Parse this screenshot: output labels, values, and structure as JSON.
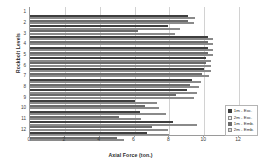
{
  "chart_data": {
    "type": "bar",
    "orientation": "horizontal",
    "title": "",
    "xlabel": "Axial Force (ton.)",
    "ylabel": "Rockbolt Levels",
    "categories": [
      "1",
      "2",
      "3",
      "4",
      "5",
      "6",
      "7",
      "8",
      "9",
      "10",
      "11",
      "12"
    ],
    "xticks": [
      0,
      2,
      4,
      6,
      8,
      10,
      12
    ],
    "xlim": [
      0,
      12
    ],
    "grid": true,
    "legend_position": "bottom-right",
    "series": [
      {
        "name": "1m - Exc.",
        "color": "#3f3f3f",
        "values": [
          9.1,
          7.9,
          10.2,
          10.2,
          10.1,
          10.0,
          9.3,
          9.0,
          6.0,
          6.3,
          8.2,
          6.7
        ]
      },
      {
        "name": "2m - Exc.",
        "color": "#f2f2f2",
        "values": [
          9.5,
          8.6,
          10.5,
          10.5,
          10.4,
          10.4,
          9.8,
          9.6,
          7.3,
          7.8,
          9.6,
          8.0
        ]
      },
      {
        "name": "1m - Emb.",
        "color": "#6b6b6b",
        "values": [
          9.1,
          6.2,
          10.2,
          10.2,
          10.1,
          9.9,
          9.2,
          8.4,
          6.6,
          5.1,
          7.0,
          5.0
        ]
      },
      {
        "name": "2m - Emb.",
        "color": "#d6d6d6",
        "values": [
          9.4,
          8.3,
          10.5,
          10.5,
          10.4,
          10.3,
          9.7,
          9.4,
          7.4,
          6.4,
          7.9,
          5.4
        ]
      }
    ]
  }
}
